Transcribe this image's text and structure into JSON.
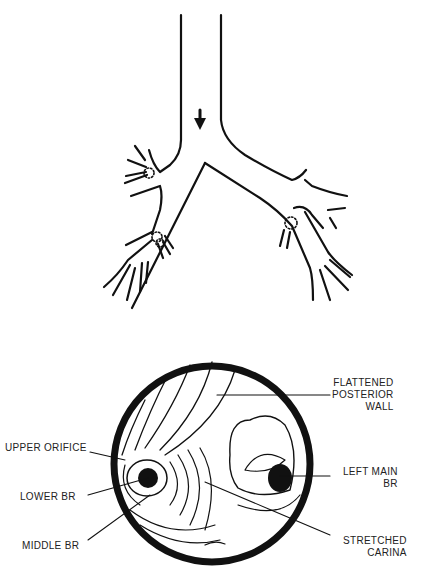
{
  "diagram": {
    "top_figure": {
      "name": "bronchial-tree",
      "arrow": "down-arrow-icon",
      "markers": [
        "right-upper-lobe-orifice",
        "right-middle-lower-orifice",
        "left-lower-orifice"
      ]
    },
    "bottom_figure": {
      "name": "bronchoscopic-view",
      "labels": {
        "flattened_posterior_wall": "FLATTENED\nPOSTERIOR\nWALL",
        "upper_orifice": "UPPER ORIFICE",
        "lower_br": "LOWER BR",
        "middle_br": "MIDDLE BR",
        "left_main_br": "LEFT MAIN\nBR",
        "stretched_carina": "STRETCHED\nCARINA"
      }
    },
    "colors": {
      "ink": "#111111",
      "background": "#ffffff",
      "label": "#222222"
    }
  }
}
